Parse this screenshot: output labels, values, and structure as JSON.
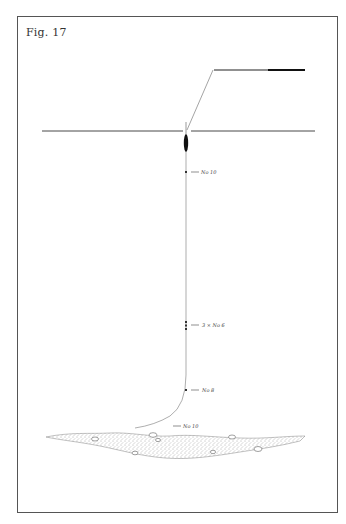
{
  "figure": {
    "label": "Fig. 17"
  },
  "shot_markers": [
    {
      "label": "No 10",
      "y": 172
    },
    {
      "label": "3 × No 6",
      "y": 325
    },
    {
      "label": "No 8",
      "y": 390
    },
    {
      "label": "No 10",
      "y": 426
    }
  ],
  "colors": {
    "ink": "#333333",
    "frame": "#555555",
    "background": "#ffffff"
  }
}
